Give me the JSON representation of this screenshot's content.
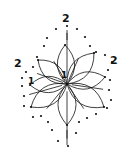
{
  "diagram": {
    "type": "dot-to-dot",
    "colors": {
      "ink": "#111111",
      "background": "#ffffff"
    },
    "labels": [
      {
        "text": "2",
        "x": 62,
        "y": 22
      },
      {
        "text": "2",
        "x": 14,
        "y": 67
      },
      {
        "text": "2",
        "x": 110,
        "y": 64
      },
      {
        "text": "1",
        "x": 28,
        "y": 84
      },
      {
        "text": "1",
        "x": 61,
        "y": 78
      }
    ],
    "center": {
      "x": 67,
      "y": 84
    },
    "outline_dots": [
      [
        67,
        26
      ],
      [
        77,
        29
      ],
      [
        85,
        37
      ],
      [
        90,
        46
      ],
      [
        96,
        52
      ],
      [
        105,
        55
      ],
      [
        112,
        62
      ],
      [
        108,
        70
      ],
      [
        110,
        80
      ],
      [
        109,
        90
      ],
      [
        111,
        100
      ],
      [
        107,
        108
      ],
      [
        96,
        114
      ],
      [
        87,
        118
      ],
      [
        79,
        122
      ],
      [
        76,
        133
      ],
      [
        68,
        146
      ],
      [
        58,
        141
      ],
      [
        52,
        130
      ],
      [
        48,
        122
      ],
      [
        41,
        116
      ],
      [
        33,
        117
      ],
      [
        24,
        106
      ],
      [
        24,
        96
      ],
      [
        22,
        86
      ],
      [
        22,
        78
      ],
      [
        26,
        72
      ],
      [
        33,
        67
      ],
      [
        37,
        57
      ],
      [
        44,
        46
      ],
      [
        47,
        38
      ],
      [
        56,
        29
      ]
    ],
    "inner_dots": [
      [
        65,
        45
      ],
      [
        30,
        85
      ],
      [
        67,
        125
      ],
      [
        105,
        77
      ],
      [
        31,
        107
      ],
      [
        104,
        107
      ],
      [
        94,
        53
      ],
      [
        38,
        60
      ]
    ],
    "petals": [
      {
        "tip": [
          65,
          45
        ]
      },
      {
        "tip": [
          30,
          85
        ]
      },
      {
        "tip": [
          67,
          125
        ]
      },
      {
        "tip": [
          105,
          77
        ]
      },
      {
        "tip": [
          31,
          107
        ]
      },
      {
        "tip": [
          104,
          107
        ]
      },
      {
        "tip": [
          94,
          53
        ]
      },
      {
        "tip": [
          38,
          60
        ]
      }
    ]
  }
}
